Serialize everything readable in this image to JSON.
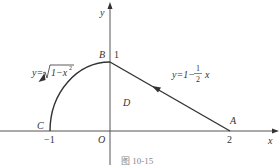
{
  "diagram": {
    "axes": {
      "x_label": "x",
      "y_label": "y",
      "origin_label": "O"
    },
    "points": {
      "A": {
        "label": "A",
        "tick": "2"
      },
      "B": {
        "label": "B",
        "tick": "1"
      },
      "C": {
        "label": "C",
        "tick": "−1"
      },
      "D": {
        "label": "D"
      }
    },
    "curves": {
      "arc_equation": {
        "prefix": "y=",
        "radicand": "1−x",
        "exp": "2"
      },
      "line_equation": {
        "prefix": "y=1−",
        "num": "1",
        "den": "2",
        "suffix": "x"
      }
    },
    "caption": "图 10-15",
    "colors": {
      "stroke": "#333333",
      "axis": "#555555",
      "caption": "#888888"
    }
  }
}
